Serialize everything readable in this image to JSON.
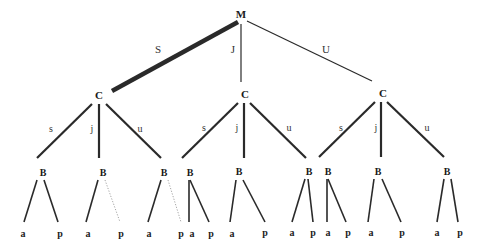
{
  "diagram": {
    "type": "game-tree",
    "root": {
      "label": "M",
      "x": 241,
      "y": 18
    },
    "level1_edges": [
      {
        "label": "S",
        "x1": 238,
        "y1": 22,
        "x2": 112,
        "y2": 91,
        "width": 4.5,
        "style": "solid",
        "lx": 158,
        "ly": 53
      },
      {
        "label": "J",
        "x1": 241,
        "y1": 24,
        "x2": 241,
        "y2": 82,
        "width": 1.2,
        "style": "solid",
        "lx": 233,
        "ly": 53
      },
      {
        "label": "U",
        "x1": 247,
        "y1": 21,
        "x2": 372,
        "y2": 81,
        "width": 1.2,
        "style": "solid",
        "lx": 326,
        "ly": 53
      }
    ],
    "level1_nodes": [
      {
        "label": "C",
        "x": 99,
        "y": 99
      },
      {
        "label": "C",
        "x": 245,
        "y": 98
      },
      {
        "label": "C",
        "x": 383,
        "y": 97
      }
    ],
    "level2_edges": [
      {
        "label": "s",
        "x1": 92,
        "y1": 104,
        "x2": 37,
        "y2": 158,
        "lx": 51,
        "ly": 132
      },
      {
        "label": "j",
        "x1": 99,
        "y1": 104,
        "x2": 99,
        "y2": 158,
        "lx": 92,
        "ly": 132
      },
      {
        "label": "u",
        "x1": 106,
        "y1": 104,
        "x2": 161,
        "y2": 158,
        "lx": 140,
        "ly": 132
      },
      {
        "label": "s",
        "x1": 238,
        "y1": 103,
        "x2": 182,
        "y2": 158,
        "lx": 204,
        "ly": 131
      },
      {
        "label": "j",
        "x1": 244,
        "y1": 103,
        "x2": 244,
        "y2": 158,
        "lx": 237,
        "ly": 131
      },
      {
        "label": "u",
        "x1": 250,
        "y1": 103,
        "x2": 306,
        "y2": 158,
        "lx": 289,
        "ly": 131
      },
      {
        "label": "s",
        "x1": 375,
        "y1": 102,
        "x2": 319,
        "y2": 157,
        "lx": 341,
        "ly": 131
      },
      {
        "label": "j",
        "x1": 381,
        "y1": 102,
        "x2": 381,
        "y2": 157,
        "lx": 376,
        "ly": 131
      },
      {
        "label": "u",
        "x1": 387,
        "y1": 102,
        "x2": 444,
        "y2": 157,
        "lx": 427,
        "ly": 131
      }
    ],
    "level2_nodes": [
      {
        "label": "B",
        "x": 43,
        "y": 176
      },
      {
        "label": "B",
        "x": 103,
        "y": 176
      },
      {
        "label": "B",
        "x": 164,
        "y": 176
      },
      {
        "label": "B",
        "x": 190,
        "y": 176
      },
      {
        "label": "B",
        "x": 239,
        "y": 175
      },
      {
        "label": "B",
        "x": 309,
        "y": 175
      },
      {
        "label": "B",
        "x": 328,
        "y": 175
      },
      {
        "label": "B",
        "x": 378,
        "y": 175
      },
      {
        "label": "B",
        "x": 447,
        "y": 175
      }
    ],
    "level3_edges": [
      {
        "x1": 37,
        "y1": 180,
        "x2": 24,
        "y2": 222,
        "style": "solid"
      },
      {
        "x1": 44,
        "y1": 180,
        "x2": 58,
        "y2": 222,
        "style": "solid"
      },
      {
        "x1": 98,
        "y1": 180,
        "x2": 86,
        "y2": 222,
        "style": "solid"
      },
      {
        "x1": 105,
        "y1": 180,
        "x2": 120,
        "y2": 222,
        "style": "dotted"
      },
      {
        "x1": 161,
        "y1": 180,
        "x2": 148,
        "y2": 222,
        "style": "solid"
      },
      {
        "x1": 168,
        "y1": 180,
        "x2": 181,
        "y2": 222,
        "style": "dotted"
      },
      {
        "x1": 189,
        "y1": 180,
        "x2": 189,
        "y2": 222,
        "style": "solid"
      },
      {
        "x1": 190,
        "y1": 180,
        "x2": 209,
        "y2": 222,
        "style": "solid"
      },
      {
        "x1": 236,
        "y1": 180,
        "x2": 230,
        "y2": 222,
        "style": "solid"
      },
      {
        "x1": 243,
        "y1": 180,
        "x2": 265,
        "y2": 222,
        "style": "solid"
      },
      {
        "x1": 305,
        "y1": 179,
        "x2": 292,
        "y2": 222,
        "style": "solid"
      },
      {
        "x1": 308,
        "y1": 179,
        "x2": 313,
        "y2": 222,
        "style": "solid"
      },
      {
        "x1": 327,
        "y1": 179,
        "x2": 327,
        "y2": 222,
        "style": "solid"
      },
      {
        "x1": 328,
        "y1": 179,
        "x2": 346,
        "y2": 222,
        "style": "solid"
      },
      {
        "x1": 374,
        "y1": 179,
        "x2": 368,
        "y2": 222,
        "style": "solid"
      },
      {
        "x1": 382,
        "y1": 179,
        "x2": 401,
        "y2": 222,
        "style": "solid"
      },
      {
        "x1": 444,
        "y1": 179,
        "x2": 437,
        "y2": 222,
        "style": "solid"
      },
      {
        "x1": 451,
        "y1": 179,
        "x2": 458,
        "y2": 222,
        "style": "solid"
      }
    ],
    "leaves": [
      {
        "label": "a",
        "x": 23,
        "y": 237
      },
      {
        "label": "p",
        "x": 60,
        "y": 237
      },
      {
        "label": "a",
        "x": 88,
        "y": 237
      },
      {
        "label": "p",
        "x": 121,
        "y": 237
      },
      {
        "label": "a",
        "x": 149,
        "y": 237
      },
      {
        "label": "p",
        "x": 181,
        "y": 237
      },
      {
        "label": "a",
        "x": 192,
        "y": 237
      },
      {
        "label": "p",
        "x": 211,
        "y": 237
      },
      {
        "label": "a",
        "x": 232,
        "y": 237
      },
      {
        "label": "p",
        "x": 265,
        "y": 236
      },
      {
        "label": "a",
        "x": 292,
        "y": 236
      },
      {
        "label": "p",
        "x": 313,
        "y": 236
      },
      {
        "label": "a",
        "x": 328,
        "y": 236
      },
      {
        "label": "p",
        "x": 348,
        "y": 236
      },
      {
        "label": "a",
        "x": 371,
        "y": 236
      },
      {
        "label": "p",
        "x": 402,
        "y": 236
      },
      {
        "label": "a",
        "x": 437,
        "y": 236
      },
      {
        "label": "p",
        "x": 460,
        "y": 236
      }
    ]
  }
}
